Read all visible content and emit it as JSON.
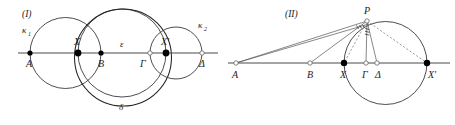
{
  "figure": {
    "background_color": "#ffffff",
    "line_color": "#4a4a4a",
    "curve_color": "#3a3a3a"
  },
  "panel_one": {
    "caption": "(I)",
    "baseline_label": "horizontal-line",
    "points": [
      {
        "id": "A",
        "label": "A",
        "x": 30,
        "y": 53,
        "marker": "filled",
        "label_dx": -4,
        "label_dy": 14
      },
      {
        "id": "X",
        "label": "X",
        "x": 78,
        "y": 53,
        "marker": "filled",
        "label_dx": -4,
        "label_dy": -8
      },
      {
        "id": "B",
        "label": "B",
        "x": 101,
        "y": 53,
        "marker": "filled",
        "label_dx": -3,
        "label_dy": 14
      },
      {
        "id": "G",
        "label": "Γ",
        "x": 150,
        "y": 53,
        "marker": "open",
        "label_dx": -10,
        "label_dy": 14
      },
      {
        "id": "Xp",
        "label": "X′",
        "x": 166,
        "y": 53,
        "marker": "filled",
        "label_dx": -5,
        "label_dy": -8
      },
      {
        "id": "D",
        "label": "Δ",
        "x": 202,
        "y": 53,
        "marker": "open",
        "label_dx": -3,
        "label_dy": 14
      }
    ],
    "circles": [
      {
        "id": "kappa1",
        "label": "κ",
        "sub": "1",
        "cx": 65.5,
        "cy": 53,
        "r": 35.5,
        "weight": "light",
        "label_x": 22,
        "label_y": 33
      },
      {
        "id": "epsilon",
        "label": "ε",
        "sub": "",
        "cx": 122,
        "cy": 53,
        "r": 44,
        "weight": "light",
        "label_x": 122,
        "label_y": 47
      },
      {
        "id": "delta",
        "label": "δ",
        "sub": "",
        "cx": 123,
        "cy": 57.5,
        "r": 48.5,
        "weight": "dark",
        "label_x": 122,
        "label_y": 110
      },
      {
        "id": "kappa2",
        "label": "κ",
        "sub": "2",
        "cx": 176,
        "cy": 53,
        "r": 26,
        "weight": "light",
        "label_x": 201,
        "label_y": 28
      }
    ],
    "baseline": {
      "x1": 18,
      "x2": 218,
      "y": 53
    }
  },
  "panel_two": {
    "caption": "(II)",
    "points": [
      {
        "id": "A",
        "label": "A",
        "x": 236,
        "y": 63,
        "marker": "open",
        "label_dx": -4,
        "label_dy": 15
      },
      {
        "id": "B",
        "label": "B",
        "x": 310,
        "y": 63,
        "marker": "open",
        "label_dx": -3,
        "label_dy": 15
      },
      {
        "id": "X",
        "label": "X",
        "x": 344,
        "y": 63,
        "marker": "filled",
        "label_dx": -4,
        "label_dy": 15
      },
      {
        "id": "G",
        "label": "Γ",
        "x": 366,
        "y": 63,
        "marker": "open",
        "label_dx": -3,
        "label_dy": 15
      },
      {
        "id": "D",
        "label": "Δ",
        "x": 377,
        "y": 63,
        "marker": "open",
        "label_dx": 1,
        "label_dy": 15
      },
      {
        "id": "Xp",
        "label": "X′",
        "x": 427,
        "y": 63,
        "marker": "filled",
        "label_dx": 1,
        "label_dy": 15
      },
      {
        "id": "P",
        "label": "P",
        "x": 367,
        "y": 21,
        "marker": "open",
        "label_dx": -3,
        "label_dy": -5
      }
    ],
    "circle": {
      "id": "main-circle",
      "cx": 385.5,
      "cy": 63,
      "r": 41.5
    },
    "baseline": {
      "x1": 228,
      "x2": 450,
      "y": 63
    },
    "solid_rays": [
      {
        "from": "A",
        "to": "P"
      },
      {
        "from": "B",
        "to": "P"
      },
      {
        "from": "P",
        "to": "G"
      },
      {
        "from": "P",
        "to": "D"
      }
    ],
    "dashed_rays": [
      {
        "from": "P",
        "to": "X"
      },
      {
        "from": "P",
        "to": "Xp"
      },
      {
        "from": "A",
        "to": "Xp_upper"
      }
    ],
    "angle_marks_at_P": 3
  }
}
